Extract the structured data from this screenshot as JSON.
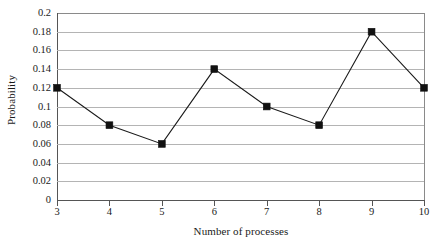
{
  "chart_data": {
    "type": "line",
    "title": "",
    "xlabel": "Number of processes",
    "ylabel": "Probability",
    "x": [
      3,
      4,
      5,
      6,
      7,
      8,
      9,
      10
    ],
    "categories": [
      "3",
      "4",
      "5",
      "6",
      "7",
      "8",
      "9",
      "10"
    ],
    "values": [
      0.12,
      0.08,
      0.06,
      0.14,
      0.1,
      0.08,
      0.18,
      0.12
    ],
    "series": [
      {
        "name": "Probability",
        "values": [
          0.12,
          0.08,
          0.06,
          0.14,
          0.1,
          0.08,
          0.18,
          0.12
        ]
      }
    ],
    "xlim": [
      3,
      10
    ],
    "ylim": [
      0,
      0.2
    ],
    "xticks": [
      3,
      4,
      5,
      6,
      7,
      8,
      9,
      10
    ],
    "xtick_labels": [
      "3",
      "4",
      "5",
      "6",
      "7",
      "8",
      "9",
      "10"
    ],
    "yticks": [
      0,
      0.02,
      0.04,
      0.06,
      0.08,
      0.1,
      0.12,
      0.14,
      0.16,
      0.18,
      0.2
    ],
    "ytick_labels": [
      "0",
      "0.02",
      "0.04",
      "0.06",
      "0.08",
      "0.1",
      "0.12",
      "0.14",
      "0.16",
      "0.18",
      "0.2"
    ],
    "grid": "horizontal",
    "legend": "none",
    "marker": "square",
    "marker_color": "#111111",
    "line_color": "#1a1a1a",
    "gridline_color": "#b4b4b4",
    "axis_color": "#555555",
    "background": "#ffffff"
  }
}
